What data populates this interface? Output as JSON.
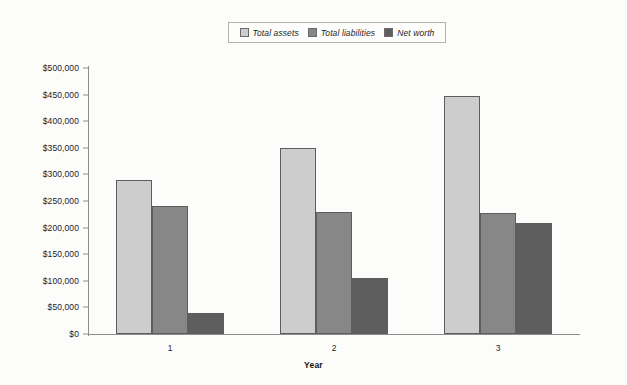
{
  "chart_data": {
    "type": "bar",
    "title": "",
    "xlabel": "Year",
    "ylabel": "",
    "categories": [
      "1",
      "2",
      "3"
    ],
    "series": [
      {
        "name": "Total assets",
        "color": "#cdcdcd",
        "values": [
          290000,
          350000,
          448000
        ]
      },
      {
        "name": "Total liabilities",
        "color": "#878787",
        "values": [
          240000,
          230000,
          227000
        ]
      },
      {
        "name": "Net worth",
        "color": "#5e5e5e",
        "values": [
          40000,
          105000,
          208000
        ]
      }
    ],
    "ylim": [
      0,
      500000
    ],
    "ytick_values": [
      0,
      50000,
      100000,
      150000,
      200000,
      250000,
      300000,
      350000,
      400000,
      450000,
      500000
    ],
    "ytick_labels": [
      "$0",
      "$50,000",
      "$100,000",
      "$150,000",
      "$200,000",
      "$250,000",
      "$300,000",
      "$350,000",
      "$400,000",
      "$450,000",
      "$500,000"
    ],
    "grid": false,
    "legend_position": "top-center"
  },
  "legend": {
    "items": [
      {
        "label": "Total assets",
        "swatch": "#cdcdcd"
      },
      {
        "label": "Total liabilities",
        "swatch": "#878787"
      },
      {
        "label": "Net worth",
        "swatch": "#5e5e5e"
      }
    ]
  },
  "axis": {
    "x_title": "Year"
  }
}
